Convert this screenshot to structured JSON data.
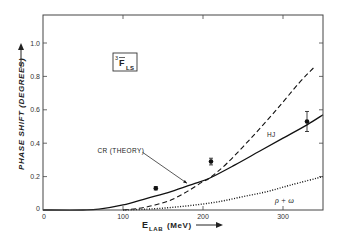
{
  "chart_data": {
    "type": "line",
    "title": "",
    "panel_label": {
      "main": "3",
      "letter": "F",
      "sub": "LS"
    },
    "xlabel": "E",
    "xlabel_sub": "LAB",
    "xlabel_unit": "(MeV)",
    "ylabel": "PHASE SHIFT (DEGREES)",
    "xlim": [
      0,
      350
    ],
    "ylim": [
      0,
      1.15
    ],
    "xticks": [
      0,
      100,
      200,
      300
    ],
    "xtick_labels": [
      "0",
      "100",
      "200",
      "300"
    ],
    "yticks": [
      0,
      0.2,
      0.4,
      0.6,
      0.8,
      1.0
    ],
    "ytick_labels": [
      "0",
      "0.2",
      "0.4",
      "0.6",
      "0.8",
      "1.0"
    ],
    "grid": false,
    "legend": "none (inline curve labels)",
    "series": [
      {
        "name": "CR (THEORY)",
        "style": "solid",
        "x": [
          0,
          50,
          70,
          100,
          130,
          160,
          190,
          208,
          240,
          270,
          300,
          330,
          350
        ],
        "y": [
          0,
          0,
          0.005,
          0.03,
          0.07,
          0.11,
          0.16,
          0.19,
          0.27,
          0.35,
          0.43,
          0.51,
          0.57
        ]
      },
      {
        "name": "HJ",
        "style": "dashed",
        "x": [
          100,
          120,
          140,
          160,
          180,
          200,
          208,
          230,
          260,
          290,
          320,
          340
        ],
        "y": [
          0,
          0.01,
          0.03,
          0.06,
          0.11,
          0.17,
          0.19,
          0.28,
          0.43,
          0.59,
          0.76,
          0.86
        ]
      },
      {
        "name": "ρ + ω",
        "style": "dotted",
        "x": [
          100,
          130,
          160,
          190,
          220,
          250,
          280,
          310,
          350
        ],
        "y": [
          0,
          0.005,
          0.015,
          0.03,
          0.05,
          0.08,
          0.11,
          0.15,
          0.2
        ]
      }
    ],
    "points": [
      {
        "x": 141,
        "y": 0.13,
        "err": 0.01
      },
      {
        "x": 210,
        "y": 0.29,
        "err": 0.02
      },
      {
        "x": 330,
        "y": 0.53,
        "err": 0.06
      }
    ],
    "annotations": [
      {
        "text": "CR (THEORY)",
        "x": 68,
        "y": 0.34,
        "arrow_to": [
          180,
          0.16
        ]
      },
      {
        "text": "HJ",
        "x": 280,
        "y": 0.44
      },
      {
        "text": "ρ + ω",
        "x": 290,
        "y": 0.04
      }
    ]
  }
}
